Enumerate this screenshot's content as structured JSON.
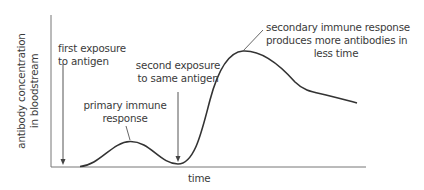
{
  "diagram": {
    "title": "",
    "axes": {
      "y_label_line1": "antibody concentration",
      "y_label_line2": "in bloodstream",
      "x_label": "time"
    },
    "annotations": {
      "first_exposure_line1": "first exposure",
      "first_exposure_line2": "to antigen",
      "second_exposure_line1": "second exposure",
      "second_exposure_line2": "to same antigen",
      "primary_line1": "primary immune",
      "primary_line2": "response",
      "secondary_line1": "secondary immune response",
      "secondary_line2": "produces more antibodies in",
      "secondary_line3": "less time"
    },
    "colors": {
      "curve": "#333333",
      "axis": "#666666",
      "text": "#3a3a3a"
    }
  }
}
